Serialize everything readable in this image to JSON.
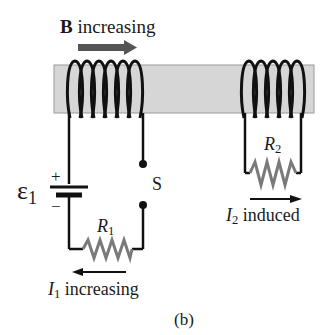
{
  "figure": {
    "panel_label": "(b)",
    "field_label": {
      "bold": "B",
      "text": " increasing"
    },
    "emf_label": {
      "symbol": "ε",
      "subscript": "1"
    },
    "battery": {
      "plus": "+",
      "minus": "−"
    },
    "switch_label": "S",
    "resistor1": {
      "symbol": "R",
      "subscript": "1"
    },
    "resistor2": {
      "symbol": "R",
      "subscript": "2"
    },
    "current1": {
      "symbol": "I",
      "subscript": "1",
      "text": " increasing"
    },
    "current2": {
      "symbol": "I",
      "subscript": "2",
      "text": " induced"
    },
    "colors": {
      "core": "#d6d6d6",
      "wire": "#111111",
      "resistor": "#7a7a7a",
      "field_arrow": "#555555"
    }
  }
}
